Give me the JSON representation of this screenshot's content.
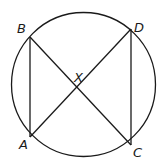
{
  "diagram": {
    "type": "circle-with-chords",
    "circle": {
      "cx": 83.5,
      "cy": 84.5,
      "r": 72
    },
    "points": {
      "A": {
        "x": 30,
        "y": 137,
        "label": "A",
        "lx": 19,
        "ly": 149
      },
      "B": {
        "x": 30,
        "y": 37,
        "label": "B",
        "lx": 17,
        "ly": 33
      },
      "C": {
        "x": 131,
        "y": 145,
        "label": "C",
        "lx": 133,
        "ly": 157
      },
      "D": {
        "x": 131,
        "y": 29,
        "label": "D",
        "lx": 134,
        "ly": 32
      },
      "X": {
        "x": 78,
        "y": 87,
        "label": "X",
        "lx": 74,
        "ly": 82
      }
    },
    "segments": [
      "AB",
      "DC",
      "BC",
      "AD"
    ],
    "colors": {
      "stroke": "#1a1a1a",
      "background": "#ffffff"
    }
  }
}
